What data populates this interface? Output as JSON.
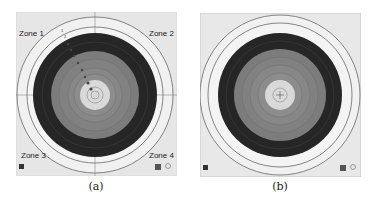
{
  "figure": {
    "panels": [
      {
        "id": "a",
        "caption": "(a)",
        "zones": [
          "Zone 1",
          "Zone 2",
          "Zone 3",
          "Zone 4"
        ],
        "arrow_numbers": [
          "1",
          "2",
          "3",
          "4",
          "5",
          "6",
          "7",
          "8",
          "9"
        ],
        "has_zone_labels": true,
        "has_center_cross": false
      },
      {
        "id": "b",
        "caption": "(b)",
        "zones": [],
        "has_zone_labels": false,
        "has_center_cross": true
      }
    ],
    "colors": {
      "paper": "#e8e8e8",
      "outer_ring": "#f2f2f2",
      "dark_band": "#262626",
      "gray_band": "#7a7a7a",
      "inner_gray": "#8a8a8a",
      "center": "#d8d8d8",
      "line": "#555555"
    }
  }
}
